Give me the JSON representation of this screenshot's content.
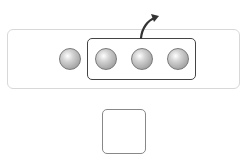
{
  "diagram": {
    "total_balls": 4,
    "grouped_balls": 3,
    "answer_box": ""
  },
  "balls": [
    {
      "left": 59,
      "top": 48,
      "grouped": false
    },
    {
      "left": 95,
      "top": 48,
      "grouped": true
    },
    {
      "left": 131,
      "top": 48,
      "grouped": true
    },
    {
      "left": 167,
      "top": 48,
      "grouped": true
    }
  ],
  "colors": {
    "panel_border": "#d8d8d8",
    "group_border": "#444444",
    "ball": "#a9a9a9",
    "arrow": "#333333",
    "answer_border": "#888888"
  }
}
